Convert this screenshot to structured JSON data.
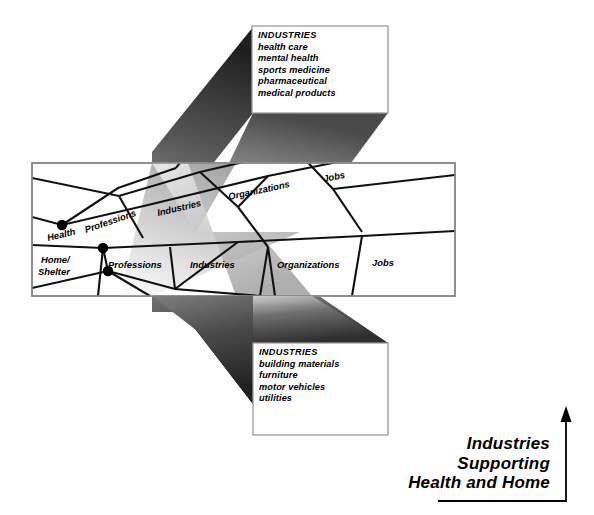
{
  "figure": {
    "title_caption": {
      "line1": "Industries",
      "line2": "Supporting",
      "line3": "Health and Home"
    },
    "upper_box": {
      "heading": "INDUSTRIES",
      "items": [
        "health care",
        "mental health",
        "sports medicine",
        "pharmaceutical",
        "medical products"
      ]
    },
    "lower_box": {
      "heading": "INDUSTRIES",
      "items": [
        "building materials",
        "furniture",
        "motor vehicles",
        "utilities"
      ]
    },
    "network": {
      "upper_layer_labels": [
        {
          "text": "Health",
          "x": 48,
          "y": 241,
          "rotate": -13
        },
        {
          "text": "Professions",
          "x": 86,
          "y": 233,
          "rotate": -19
        },
        {
          "text": "Industries",
          "x": 158,
          "y": 216,
          "rotate": -13
        },
        {
          "text": "Organizations",
          "x": 229,
          "y": 200,
          "rotate": -12
        },
        {
          "text": "Jobs",
          "x": 324,
          "y": 182,
          "rotate": -11
        }
      ],
      "lower_layer_labels": [
        {
          "text": "Home/",
          "x": 41,
          "y": 263,
          "rotate": 0
        },
        {
          "text": "Shelter",
          "x": 38,
          "y": 275,
          "rotate": 0
        },
        {
          "text": "Professions",
          "x": 108,
          "y": 268,
          "rotate": 0
        },
        {
          "text": "Industries",
          "x": 190,
          "y": 268,
          "rotate": 0
        },
        {
          "text": "Organizations",
          "x": 277,
          "y": 268,
          "rotate": 0
        },
        {
          "text": "Jobs",
          "x": 372,
          "y": 266,
          "rotate": 0
        }
      ],
      "nodes": [
        {
          "cx": 62,
          "cy": 225,
          "r": 5
        },
        {
          "cx": 103,
          "cy": 248,
          "r": 5
        },
        {
          "cx": 108,
          "cy": 271,
          "r": 5
        }
      ]
    },
    "colors": {
      "ink": "#000000",
      "panel_border": "#8a8a8a",
      "beam_dark": "#2a2a2a",
      "beam_mid": "#6e6e6e",
      "beam_light": "#d6d6d6",
      "wedge_gray": "#b4b4b4",
      "box_fill": "#ffffff"
    }
  }
}
